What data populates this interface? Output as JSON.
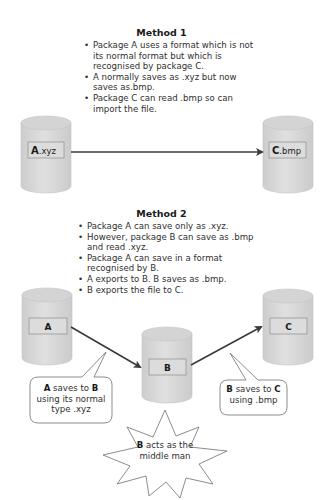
{
  "method1": {
    "heading": "Method 1",
    "bullets": [
      "Package A uses a format which is not its normal format but which is recognised by package C.",
      "A normally saves as .xyz but now saves as.bmp.",
      "Package C can read .bmp so can import the file."
    ],
    "nodes": [
      {
        "id": "A",
        "label_bold": "A",
        "label_rest": ".xyz"
      },
      {
        "id": "C",
        "label_bold": "C",
        "label_rest": ".bmp"
      }
    ]
  },
  "method2": {
    "heading": "Method 2",
    "bullets": [
      "Package A can save only as .xyz.",
      "However, package B can save as .bmp and read .xyz.",
      "Package A can save in a format recognised by B.",
      "A exports to B. B saves as .bmp.",
      "B exports the file to C."
    ],
    "nodes": [
      {
        "id": "A",
        "label": "A"
      },
      {
        "id": "B",
        "label": "B"
      },
      {
        "id": "C",
        "label": "C"
      }
    ],
    "callouts": {
      "a_to_b": {
        "b1": "A",
        "t1": " saves to ",
        "b2": "B",
        "t2": "using its normal type .xyz"
      },
      "b_to_c": {
        "b1": "B",
        "t1": " saves to ",
        "b2": "C",
        "t2": "using .bmp"
      },
      "middle": {
        "b1": "B",
        "t1": " acts as the",
        "t2": "middle man"
      }
    }
  },
  "colors": {
    "cylinder_fill": "#d9d9d9",
    "cylinder_top": "#cfcfcf",
    "cylinder_stroke": "#bdbdbd",
    "arrow": "#3a3a3a",
    "callout_stroke": "#6e6e6e"
  }
}
